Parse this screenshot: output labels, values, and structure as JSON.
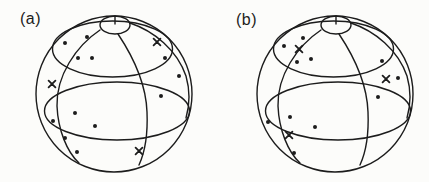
{
  "figure": {
    "background_color": "#fcfcfa",
    "ink_color": "#1c1c1c",
    "marker_legend": {
      "dot": "filled-circle",
      "cross": "x-mark"
    },
    "panels": [
      {
        "label": "(a)",
        "dot_count": 12,
        "cross_count": 3,
        "dots": [
          [
            -49,
            -51
          ],
          [
            -27,
            -57
          ],
          [
            -36,
            -36
          ],
          [
            -22,
            -36
          ],
          [
            51,
            -36
          ],
          [
            65,
            -18
          ],
          [
            47,
            2
          ],
          [
            -39,
            19
          ],
          [
            -61,
            27
          ],
          [
            -19,
            32
          ],
          [
            -49,
            44
          ],
          [
            -37,
            58
          ]
        ],
        "crosses": [
          [
            -62,
            -10
          ],
          [
            43,
            -52
          ],
          [
            25,
            57
          ]
        ]
      },
      {
        "label": "(b)",
        "dot_count": 11,
        "cross_count": 3,
        "dots": [
          [
            -51,
            -48
          ],
          [
            -32,
            -56
          ],
          [
            -38,
            -32
          ],
          [
            -24,
            -35
          ],
          [
            47,
            -33
          ],
          [
            63,
            -16
          ],
          [
            43,
            3
          ],
          [
            -45,
            23
          ],
          [
            -67,
            28
          ],
          [
            -20,
            33
          ],
          [
            -41,
            59
          ]
        ],
        "crosses": [
          [
            -36,
            -45
          ],
          [
            51,
            -15
          ],
          [
            -46,
            41
          ]
        ]
      }
    ]
  }
}
